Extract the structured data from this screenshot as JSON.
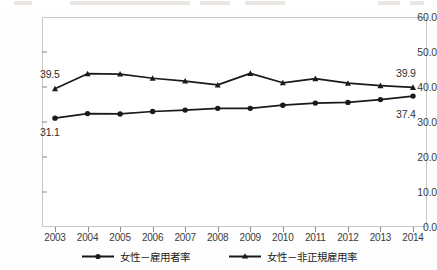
{
  "chart_data": {
    "type": "line",
    "title": "",
    "subtitle": "",
    "xlabel": "",
    "ylabel": "",
    "categories": [
      "2003",
      "2004",
      "2005",
      "2006",
      "2007",
      "2008",
      "2009",
      "2010",
      "2011",
      "2012",
      "2013",
      "2014"
    ],
    "ylim": [
      0.0,
      60.0
    ],
    "yticks": [
      "0.0",
      "10.0",
      "20.0",
      "30.0",
      "40.0",
      "50.0",
      "60.0"
    ],
    "ytick_values": [
      0.0,
      10.0,
      20.0,
      30.0,
      40.0,
      50.0,
      60.0
    ],
    "grid": false,
    "legend_position": "bottom",
    "series": [
      {
        "name": "女性－非正規雇用率",
        "marker": "triangle",
        "color": "#1a1a1a",
        "values": [
          39.5,
          43.8,
          43.7,
          42.5,
          41.7,
          40.6,
          43.9,
          41.2,
          42.4,
          41.1,
          40.4,
          39.9
        ],
        "start_label": "39.5",
        "end_label": "39.9"
      },
      {
        "name": "女性－雇用者率",
        "marker": "circle",
        "color": "#1a1a1a",
        "values": [
          31.1,
          32.4,
          32.3,
          33.0,
          33.4,
          33.9,
          33.9,
          34.8,
          35.4,
          35.6,
          36.4,
          37.4
        ],
        "start_label": "31.1",
        "end_label": "37.4"
      }
    ],
    "annotations": [
      {
        "text": "39.5",
        "series": "女性－非正規雇用率",
        "point": "2003",
        "position": "left-above"
      },
      {
        "text": "39.9",
        "series": "女性－非正規雇用率",
        "point": "2014",
        "position": "right-above"
      },
      {
        "text": "31.1",
        "series": "女性－雇用者率",
        "point": "2003",
        "position": "left-below"
      },
      {
        "text": "37.4",
        "series": "女性－雇用者率",
        "point": "2014",
        "position": "right-below"
      }
    ]
  },
  "legend": {
    "items": [
      {
        "label": "女性－雇用者率",
        "marker": "circle"
      },
      {
        "label": "女性－非正規雇用率",
        "marker": "triangle"
      }
    ]
  },
  "axes": {
    "ytick_labels": [
      "60.0",
      "50.0",
      "40.0",
      "30.0",
      "20.0",
      "10.0",
      "0.0"
    ],
    "xtick_labels": [
      "2003",
      "2004",
      "2005",
      "2006",
      "2007",
      "2008",
      "2009",
      "2010",
      "2011",
      "2012",
      "2013",
      "2014"
    ]
  },
  "value_labels": {
    "top_left": "39.5",
    "top_right": "39.9",
    "bottom_left": "31.1",
    "bottom_right": "37.4"
  },
  "colors": {
    "line": "#1a1a1a",
    "frame": "#c9c6c0",
    "text": "#3b3b3b",
    "background": "#ffffff"
  }
}
